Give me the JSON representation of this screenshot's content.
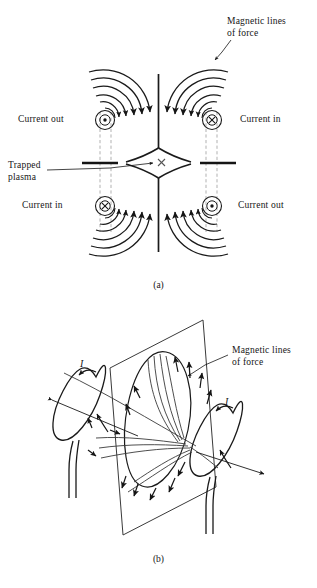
{
  "figure": {
    "panel_a": {
      "caption": "(a)",
      "labels": {
        "magnetic_lines": "Magnetic lines\nof force",
        "current_out_top_left": "Current out",
        "current_in_top_right": "Current in",
        "trapped_plasma": "Trapped\nplasma",
        "current_in_bottom_left": "Current in",
        "current_out_bottom_right": "Current out"
      },
      "symbols": {
        "current_out": "dot-in-circle",
        "current_in": "cross-in-circle",
        "null_point": "x-point"
      }
    },
    "panel_b": {
      "caption": "(b)",
      "labels": {
        "magnetic_lines": "Magnetic lines\nof force",
        "current_left": "I",
        "current_right": "I"
      },
      "symbols": {
        "plane": "parallelogram-plane",
        "loop_left": "current-loop",
        "loop_right": "current-loop"
      }
    },
    "colors": {
      "ink": "#151515",
      "line": "#1a1a1a",
      "dash": "#9a9a9a",
      "thin": "#3a3a3a"
    }
  }
}
